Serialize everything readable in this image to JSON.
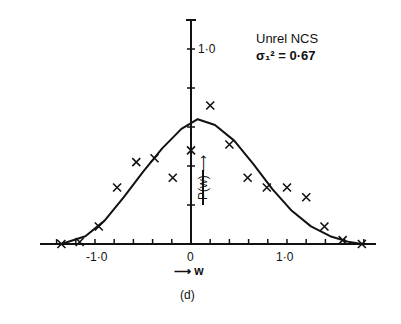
{
  "chart_data": {
    "type": "scatter",
    "title": "",
    "legend": [
      "Unrel NCS",
      "σ₁² = 0·67"
    ],
    "caption": "(d)",
    "xlabel": "w",
    "ylabel": "P(w)",
    "xlim": [
      -1.5,
      1.9
    ],
    "ylim": [
      0,
      1.2
    ],
    "x_ticks_labeled": [
      "-1·0",
      "0",
      "1·0"
    ],
    "y_ticks_labeled": [
      "1·0"
    ],
    "x_tick_step": 0.2,
    "y_tick_step": 0.2,
    "grid": false,
    "series": [
      {
        "name": "measured",
        "marker": "x",
        "points": [
          [
            -1.35,
            0.0
          ],
          [
            -1.16,
            0.01
          ],
          [
            -0.96,
            0.09
          ],
          [
            -0.77,
            0.29
          ],
          [
            -0.57,
            0.42
          ],
          [
            -0.38,
            0.44
          ],
          [
            -0.19,
            0.34
          ],
          [
            0.0,
            0.48
          ],
          [
            0.2,
            0.71
          ],
          [
            0.4,
            0.51
          ],
          [
            0.59,
            0.34
          ],
          [
            0.79,
            0.29
          ],
          [
            1.0,
            0.29
          ],
          [
            1.2,
            0.24
          ],
          [
            1.39,
            0.09
          ],
          [
            1.58,
            0.02
          ],
          [
            1.78,
            0.0
          ]
        ]
      },
      {
        "name": "theory",
        "style": "line",
        "points": [
          [
            -1.35,
            0.0
          ],
          [
            -1.1,
            0.04
          ],
          [
            -0.9,
            0.12
          ],
          [
            -0.7,
            0.24
          ],
          [
            -0.5,
            0.37
          ],
          [
            -0.3,
            0.49
          ],
          [
            -0.1,
            0.59
          ],
          [
            0.07,
            0.64
          ],
          [
            0.25,
            0.61
          ],
          [
            0.45,
            0.53
          ],
          [
            0.65,
            0.41
          ],
          [
            0.85,
            0.28
          ],
          [
            1.05,
            0.17
          ],
          [
            1.25,
            0.09
          ],
          [
            1.45,
            0.04
          ],
          [
            1.65,
            0.01
          ],
          [
            1.78,
            0.0
          ]
        ]
      }
    ]
  },
  "labels": {
    "legend_line1": "Unrel NCS",
    "legend_line2": "σ₁² = 0·67",
    "x_neg1": "-1·0",
    "x_zero": "0",
    "x_pos1": "1·0",
    "y_one": "1·0",
    "x_axis": "⟶ w",
    "y_axis": "P(w) ⟶",
    "caption": "(d)"
  }
}
